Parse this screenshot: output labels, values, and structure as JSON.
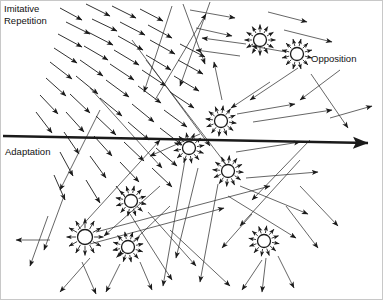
{
  "diagram": {
    "canvas": {
      "width": 383,
      "height": 300,
      "background": "#ffffff"
    },
    "colors": {
      "stroke": "#1a1a1a",
      "thin_stroke": "#333333",
      "label_text": "#111111",
      "frame": "#c8c8c8"
    },
    "labels": [
      {
        "name": "imitative-repetition-label",
        "line1": "Imitative",
        "line2": "Repetition",
        "x": 4,
        "y": 12,
        "font_size": 9.5
      },
      {
        "name": "opposition-label",
        "text": "Opposition",
        "x": 311,
        "y": 62,
        "font_size": 9.5
      },
      {
        "name": "adaptation-label",
        "text": "Adaptation",
        "x": 5,
        "y": 155,
        "font_size": 9.5
      }
    ],
    "main_axis": {
      "name": "adaptation-axis-arrow",
      "label": "Adaptation",
      "x1": 3,
      "y1": 136,
      "x2": 368,
      "y2": 143,
      "stroke_width": 2.4,
      "arrowhead": "solid-triangle-large"
    },
    "nodes": [
      {
        "name": "node-top-center",
        "cx": 260,
        "cy": 40,
        "r": 6.5,
        "rays": 12,
        "ray_len": 9,
        "rotation": 0
      },
      {
        "name": "node-opposition",
        "cx": 297,
        "cy": 54,
        "r": 6.5,
        "rays": 12,
        "ray_len": 9,
        "rotation": 15
      },
      {
        "name": "node-upper-mid",
        "cx": 221,
        "cy": 121,
        "r": 6.5,
        "rays": 12,
        "ray_len": 9,
        "rotation": 8
      },
      {
        "name": "node-center-left",
        "cx": 189,
        "cy": 148,
        "r": 6.5,
        "rays": 12,
        "ray_len": 9,
        "rotation": 20
      },
      {
        "name": "node-center-right",
        "cx": 228,
        "cy": 171,
        "r": 6.5,
        "rays": 12,
        "ray_len": 9,
        "rotation": 5
      },
      {
        "name": "node-mid-left",
        "cx": 131,
        "cy": 201,
        "r": 6.5,
        "rays": 12,
        "ray_len": 9,
        "rotation": 12
      },
      {
        "name": "node-bottom-left",
        "cx": 85,
        "cy": 237,
        "r": 7.5,
        "rays": 12,
        "ray_len": 11,
        "rotation": 0
      },
      {
        "name": "node-bottom-center",
        "cx": 128,
        "cy": 247,
        "r": 6.5,
        "rays": 12,
        "ray_len": 9,
        "rotation": 18
      },
      {
        "name": "node-bottom-right",
        "cx": 264,
        "cy": 241,
        "r": 6.5,
        "rays": 12,
        "ray_len": 9,
        "rotation": 10
      }
    ],
    "field_arrows": [
      {
        "x1": 60,
        "y1": 8,
        "x2": 82,
        "y2": 20
      },
      {
        "x1": 86,
        "y1": 4,
        "x2": 110,
        "y2": 16
      },
      {
        "x1": 112,
        "y1": 6,
        "x2": 136,
        "y2": 18
      },
      {
        "x1": 140,
        "y1": 9,
        "x2": 163,
        "y2": 21
      },
      {
        "x1": 66,
        "y1": 22,
        "x2": 90,
        "y2": 34
      },
      {
        "x1": 92,
        "y1": 19,
        "x2": 117,
        "y2": 31
      },
      {
        "x1": 120,
        "y1": 22,
        "x2": 145,
        "y2": 35
      },
      {
        "x1": 148,
        "y1": 25,
        "x2": 172,
        "y2": 38
      },
      {
        "x1": 58,
        "y1": 34,
        "x2": 82,
        "y2": 47
      },
      {
        "x1": 88,
        "y1": 32,
        "x2": 113,
        "y2": 45
      },
      {
        "x1": 118,
        "y1": 36,
        "x2": 143,
        "y2": 50
      },
      {
        "x1": 150,
        "y1": 40,
        "x2": 175,
        "y2": 54
      },
      {
        "x1": 180,
        "y1": 44,
        "x2": 205,
        "y2": 57
      },
      {
        "x1": 54,
        "y1": 48,
        "x2": 77,
        "y2": 63
      },
      {
        "x1": 84,
        "y1": 46,
        "x2": 108,
        "y2": 60
      },
      {
        "x1": 114,
        "y1": 50,
        "x2": 139,
        "y2": 65
      },
      {
        "x1": 146,
        "y1": 55,
        "x2": 171,
        "y2": 70
      },
      {
        "x1": 178,
        "y1": 60,
        "x2": 203,
        "y2": 74
      },
      {
        "x1": 50,
        "y1": 62,
        "x2": 72,
        "y2": 79
      },
      {
        "x1": 80,
        "y1": 60,
        "x2": 103,
        "y2": 76
      },
      {
        "x1": 110,
        "y1": 64,
        "x2": 134,
        "y2": 80
      },
      {
        "x1": 142,
        "y1": 70,
        "x2": 166,
        "y2": 86
      },
      {
        "x1": 174,
        "y1": 76,
        "x2": 199,
        "y2": 91
      },
      {
        "x1": 46,
        "y1": 78,
        "x2": 66,
        "y2": 96
      },
      {
        "x1": 76,
        "y1": 76,
        "x2": 98,
        "y2": 94
      },
      {
        "x1": 106,
        "y1": 80,
        "x2": 129,
        "y2": 97
      },
      {
        "x1": 138,
        "y1": 86,
        "x2": 161,
        "y2": 103
      },
      {
        "x1": 170,
        "y1": 92,
        "x2": 194,
        "y2": 108
      },
      {
        "x1": 40,
        "y1": 95,
        "x2": 58,
        "y2": 114
      },
      {
        "x1": 70,
        "y1": 94,
        "x2": 90,
        "y2": 113
      },
      {
        "x1": 100,
        "y1": 98,
        "x2": 122,
        "y2": 116
      },
      {
        "x1": 132,
        "y1": 104,
        "x2": 154,
        "y2": 122
      },
      {
        "x1": 164,
        "y1": 110,
        "x2": 187,
        "y2": 127
      },
      {
        "x1": 36,
        "y1": 112,
        "x2": 52,
        "y2": 133
      },
      {
        "x1": 66,
        "y1": 112,
        "x2": 84,
        "y2": 132
      },
      {
        "x1": 96,
        "y1": 116,
        "x2": 116,
        "y2": 135
      },
      {
        "x1": 128,
        "y1": 122,
        "x2": 149,
        "y2": 140
      },
      {
        "x1": 160,
        "y1": 128,
        "x2": 182,
        "y2": 145
      },
      {
        "x1": 64,
        "y1": 132,
        "x2": 79,
        "y2": 154
      },
      {
        "x1": 94,
        "y1": 136,
        "x2": 112,
        "y2": 156
      },
      {
        "x1": 124,
        "y1": 142,
        "x2": 144,
        "y2": 161
      },
      {
        "x1": 156,
        "y1": 148,
        "x2": 177,
        "y2": 166
      },
      {
        "x1": 60,
        "y1": 152,
        "x2": 73,
        "y2": 176
      },
      {
        "x1": 90,
        "y1": 156,
        "x2": 106,
        "y2": 178
      },
      {
        "x1": 120,
        "y1": 162,
        "x2": 139,
        "y2": 182
      },
      {
        "x1": 152,
        "y1": 168,
        "x2": 172,
        "y2": 187
      },
      {
        "x1": 54,
        "y1": 175,
        "x2": 65,
        "y2": 200
      },
      {
        "x1": 86,
        "y1": 180,
        "x2": 100,
        "y2": 203
      },
      {
        "x1": 116,
        "y1": 186,
        "x2": 133,
        "y2": 207
      }
    ],
    "long_arrows": [
      {
        "x1": 190,
        "y1": 10,
        "x2": 235,
        "y2": 18
      },
      {
        "x1": 196,
        "y1": 28,
        "x2": 232,
        "y2": 36
      },
      {
        "x1": 268,
        "y1": 12,
        "x2": 307,
        "y2": 22
      },
      {
        "x1": 284,
        "y1": 30,
        "x2": 332,
        "y2": 42
      },
      {
        "x1": 246,
        "y1": 44,
        "x2": 202,
        "y2": 38
      },
      {
        "x1": 240,
        "y1": 56,
        "x2": 196,
        "y2": 50
      },
      {
        "x1": 286,
        "y1": 52,
        "x2": 252,
        "y2": 46
      },
      {
        "x1": 183,
        "y1": 4,
        "x2": 205,
        "y2": 64
      },
      {
        "x1": 210,
        "y1": 2,
        "x2": 180,
        "y2": 86
      },
      {
        "x1": 172,
        "y1": 6,
        "x2": 144,
        "y2": 92
      },
      {
        "x1": 155,
        "y1": 100,
        "x2": 206,
        "y2": 14
      },
      {
        "x1": 222,
        "y1": 100,
        "x2": 214,
        "y2": 62
      },
      {
        "x1": 298,
        "y1": 68,
        "x2": 250,
        "y2": 100
      },
      {
        "x1": 270,
        "y1": 82,
        "x2": 231,
        "y2": 108
      },
      {
        "x1": 311,
        "y1": 74,
        "x2": 348,
        "y2": 128
      },
      {
        "x1": 237,
        "y1": 114,
        "x2": 295,
        "y2": 104
      },
      {
        "x1": 253,
        "y1": 122,
        "x2": 332,
        "y2": 110
      },
      {
        "x1": 340,
        "y1": 70,
        "x2": 300,
        "y2": 100
      },
      {
        "x1": 132,
        "y1": 40,
        "x2": 210,
        "y2": 146
      },
      {
        "x1": 146,
        "y1": 60,
        "x2": 232,
        "y2": 172
      },
      {
        "x1": 90,
        "y1": 88,
        "x2": 162,
        "y2": 168
      },
      {
        "x1": 100,
        "y1": 110,
        "x2": 60,
        "y2": 190
      },
      {
        "x1": 200,
        "y1": 134,
        "x2": 150,
        "y2": 156
      },
      {
        "x1": 236,
        "y1": 152,
        "x2": 300,
        "y2": 142
      },
      {
        "x1": 246,
        "y1": 178,
        "x2": 318,
        "y2": 172
      },
      {
        "x1": 240,
        "y1": 186,
        "x2": 308,
        "y2": 214
      },
      {
        "x1": 228,
        "y1": 196,
        "x2": 296,
        "y2": 238
      },
      {
        "x1": 310,
        "y1": 140,
        "x2": 252,
        "y2": 200
      },
      {
        "x1": 300,
        "y1": 160,
        "x2": 240,
        "y2": 226
      },
      {
        "x1": 96,
        "y1": 232,
        "x2": 270,
        "y2": 186
      },
      {
        "x1": 90,
        "y1": 244,
        "x2": 224,
        "y2": 208
      },
      {
        "x1": 78,
        "y1": 230,
        "x2": 160,
        "y2": 140
      },
      {
        "x1": 160,
        "y1": 186,
        "x2": 104,
        "y2": 236
      },
      {
        "x1": 170,
        "y1": 206,
        "x2": 118,
        "y2": 256
      },
      {
        "x1": 198,
        "y1": 168,
        "x2": 176,
        "y2": 258
      },
      {
        "x1": 218,
        "y1": 184,
        "x2": 200,
        "y2": 282
      },
      {
        "x1": 185,
        "y1": 160,
        "x2": 163,
        "y2": 286
      },
      {
        "x1": 148,
        "y1": 212,
        "x2": 196,
        "y2": 266
      },
      {
        "x1": 130,
        "y1": 214,
        "x2": 172,
        "y2": 280
      },
      {
        "x1": 170,
        "y1": 230,
        "x2": 230,
        "y2": 286
      },
      {
        "x1": 252,
        "y1": 214,
        "x2": 222,
        "y2": 248
      },
      {
        "x1": 286,
        "y1": 206,
        "x2": 318,
        "y2": 248
      },
      {
        "x1": 300,
        "y1": 186,
        "x2": 338,
        "y2": 226
      },
      {
        "x1": 64,
        "y1": 196,
        "x2": 44,
        "y2": 250
      },
      {
        "x1": 48,
        "y1": 216,
        "x2": 30,
        "y2": 266
      },
      {
        "x1": 90,
        "y1": 258,
        "x2": 60,
        "y2": 292
      },
      {
        "x1": 82,
        "y1": 262,
        "x2": 96,
        "y2": 294
      },
      {
        "x1": 120,
        "y1": 264,
        "x2": 106,
        "y2": 292
      },
      {
        "x1": 140,
        "y1": 262,
        "x2": 152,
        "y2": 290
      },
      {
        "x1": 266,
        "y1": 258,
        "x2": 262,
        "y2": 292
      },
      {
        "x1": 262,
        "y1": 260,
        "x2": 242,
        "y2": 290
      },
      {
        "x1": 278,
        "y1": 256,
        "x2": 294,
        "y2": 288
      },
      {
        "x1": 50,
        "y1": 240,
        "x2": 16,
        "y2": 240
      },
      {
        "x1": 330,
        "y1": 118,
        "x2": 372,
        "y2": 106
      }
    ]
  }
}
